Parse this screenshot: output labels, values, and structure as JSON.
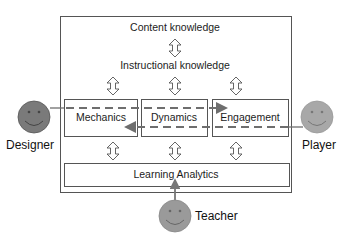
{
  "diagram": {
    "layers": {
      "content": "Content knowledge",
      "instructional": "Instructional knowledge",
      "mda": [
        "Mechanics",
        "Dynamics",
        "Engagement"
      ],
      "analytics": "Learning Analytics"
    },
    "actors": {
      "designer": "Designer",
      "player": "Player",
      "teacher": "Teacher"
    },
    "colors": {
      "designer": "#7a7a7a",
      "player": "#a8a8a8",
      "teacher": "#9a9a9a",
      "dashed_flow": "#6e6e6e",
      "border": "#555555"
    },
    "edges": [
      {
        "from": "Content knowledge",
        "to": "Instructional knowledge",
        "type": "bidirectional"
      },
      {
        "from": "Instructional knowledge",
        "to": "Mechanics",
        "type": "bidirectional"
      },
      {
        "from": "Instructional knowledge",
        "to": "Dynamics",
        "type": "bidirectional"
      },
      {
        "from": "Instructional knowledge",
        "to": "Engagement",
        "type": "bidirectional"
      },
      {
        "from": "Mechanics",
        "to": "Learning Analytics",
        "type": "bidirectional"
      },
      {
        "from": "Dynamics",
        "to": "Learning Analytics",
        "type": "bidirectional"
      },
      {
        "from": "Engagement",
        "to": "Learning Analytics",
        "type": "bidirectional"
      },
      {
        "from": "Designer",
        "to": "Engagement",
        "type": "dashed-arrow"
      },
      {
        "from": "Player",
        "to": "Mechanics",
        "type": "dashed-arrow"
      },
      {
        "from": "Teacher",
        "to": "Learning Analytics",
        "type": "arrow"
      }
    ]
  }
}
